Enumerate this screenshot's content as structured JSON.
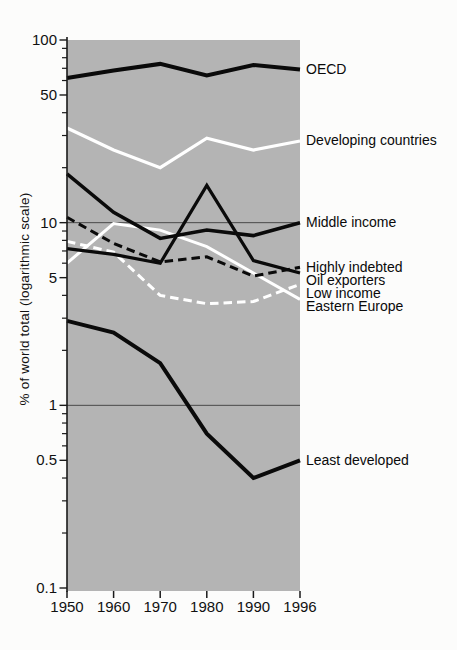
{
  "figure": {
    "title": "",
    "y_axis_title": "% of world total (logarithmic scale)"
  },
  "colors": {
    "page_bg": "#fcfcfb",
    "plot_bg": "#b4b4b4",
    "line_black": "#0a0a0a",
    "line_white": "#ffffff",
    "gridline": "#4a4a4a",
    "axis": "#1a1a1a",
    "text": "#111111"
  },
  "chart_data": {
    "type": "line",
    "yscale": "log",
    "ylim": [
      0.1,
      100
    ],
    "ylabel": "% of world total (logarithmic scale)",
    "grid_values": [
      10,
      1
    ],
    "grid_on": true,
    "legend_position": "right-of-line-endpoints",
    "x": [
      1950,
      1960,
      1970,
      1980,
      1990,
      1996
    ],
    "x_tick_labels": [
      "1950",
      "1960",
      "1970",
      "1980",
      "1990",
      "1996"
    ],
    "y_ticks": [
      {
        "label": "100",
        "value": 100
      },
      {
        "label": "50",
        "value": 50
      },
      {
        "label": "10",
        "value": 10
      },
      {
        "label": "5",
        "value": 5
      },
      {
        "label": "1",
        "value": 1
      },
      {
        "label": "0.5",
        "value": 0.5
      },
      {
        "label": "0.1",
        "value": 0.1
      }
    ],
    "series": [
      {
        "name": "Eastern Europe",
        "values": [
          6.0,
          9.9,
          9.1,
          7.4,
          5.3,
          3.8
        ],
        "color": "#ffffff",
        "dash": false,
        "width": 3
      },
      {
        "name": "Low income",
        "values": [
          7.9,
          6.9,
          4.0,
          3.6,
          3.7,
          4.6
        ],
        "color": "#ffffff",
        "dash": true,
        "width": 3
      },
      {
        "name": "Developing countries",
        "values": [
          33,
          25,
          20,
          29,
          25,
          28
        ],
        "color": "#ffffff",
        "dash": false,
        "width": 3.2
      },
      {
        "name": "Middle income",
        "values": [
          18.5,
          11.4,
          8.2,
          9.1,
          8.5,
          10
        ],
        "color": "#0a0a0a",
        "dash": false,
        "width": 3.5
      },
      {
        "name": "Oil exporters",
        "values": [
          7.2,
          6.7,
          6.0,
          16,
          6.2,
          5.3
        ],
        "color": "#0a0a0a",
        "dash": false,
        "width": 3.2
      },
      {
        "name": "Least developed",
        "values": [
          2.9,
          2.5,
          1.7,
          0.7,
          0.4,
          0.5
        ],
        "color": "#0a0a0a",
        "dash": false,
        "width": 4
      },
      {
        "name": "OECD",
        "values": [
          62,
          68,
          74,
          64,
          73,
          69
        ],
        "color": "#0a0a0a",
        "dash": false,
        "width": 4
      },
      {
        "name": "Highly indebted",
        "values": [
          10.7,
          7.7,
          6.1,
          6.5,
          5.1,
          5.7
        ],
        "color": "#0a0a0a",
        "dash": true,
        "width": 3
      }
    ]
  }
}
